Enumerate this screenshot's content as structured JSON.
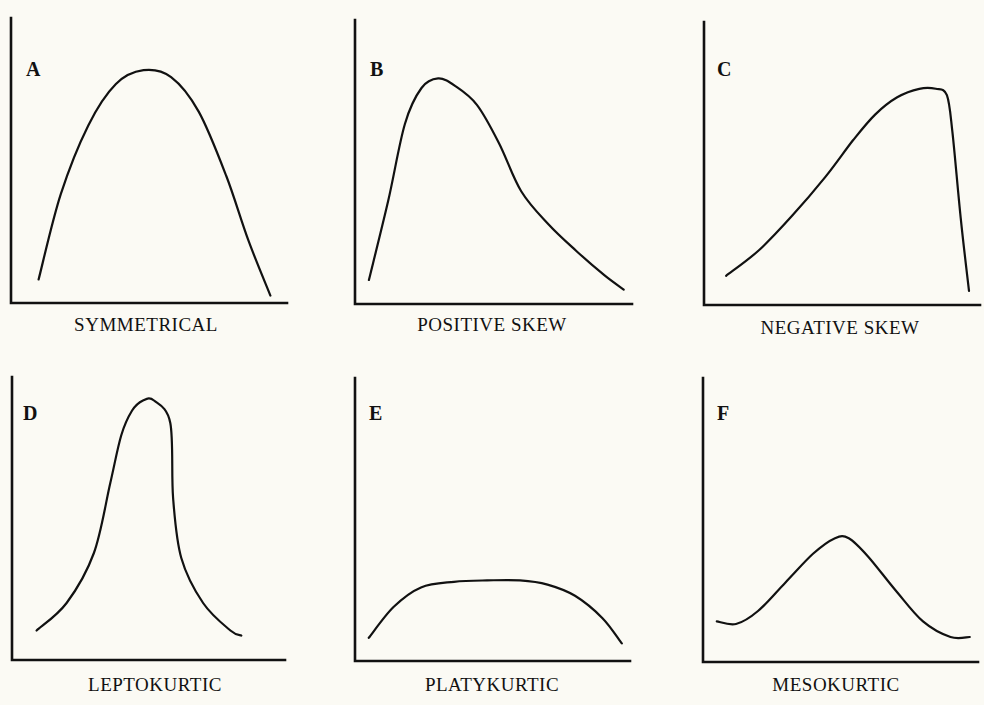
{
  "chart_data": [
    {
      "type": "line",
      "panel": "A",
      "caption": "SYMMETRICAL",
      "xlabel": "",
      "ylabel": "",
      "x": [
        0.1,
        0.18,
        0.28,
        0.38,
        0.48,
        0.58,
        0.68,
        0.78,
        0.86,
        0.94
      ],
      "y": [
        0.05,
        0.42,
        0.72,
        0.9,
        0.96,
        0.93,
        0.78,
        0.5,
        0.22,
        -0.02
      ]
    },
    {
      "type": "line",
      "panel": "B",
      "caption": "POSITIVE SKEW",
      "xlabel": "",
      "ylabel": "",
      "x": [
        0.05,
        0.12,
        0.18,
        0.24,
        0.3,
        0.36,
        0.44,
        0.52,
        0.6,
        0.7,
        0.8,
        0.9,
        0.97
      ],
      "y": [
        0.05,
        0.38,
        0.7,
        0.85,
        0.89,
        0.86,
        0.78,
        0.62,
        0.42,
        0.28,
        0.17,
        0.07,
        0.01
      ]
    },
    {
      "type": "line",
      "panel": "C",
      "caption": "NEGATIVE SKEW",
      "xlabel": "",
      "ylabel": "",
      "x": [
        0.08,
        0.2,
        0.32,
        0.44,
        0.54,
        0.62,
        0.7,
        0.78,
        0.84,
        0.88,
        0.9,
        0.93,
        0.96
      ],
      "y": [
        0.08,
        0.2,
        0.36,
        0.54,
        0.71,
        0.83,
        0.91,
        0.95,
        0.95,
        0.92,
        0.75,
        0.35,
        0.01
      ]
    },
    {
      "type": "line",
      "panel": "D",
      "caption": "LEPTOKURTIC",
      "xlabel": "",
      "ylabel": "",
      "x": [
        0.09,
        0.2,
        0.3,
        0.36,
        0.4,
        0.44,
        0.48,
        0.52,
        0.58,
        0.59,
        0.62,
        0.7,
        0.8,
        0.84
      ],
      "y": [
        0.07,
        0.18,
        0.38,
        0.66,
        0.85,
        0.95,
        0.99,
        0.99,
        0.9,
        0.6,
        0.36,
        0.18,
        0.07,
        0.05
      ]
    },
    {
      "type": "line",
      "panel": "E",
      "caption": "PLATYKURTIC",
      "xlabel": "",
      "ylabel": "",
      "x": [
        0.05,
        0.14,
        0.24,
        0.36,
        0.48,
        0.6,
        0.7,
        0.8,
        0.9,
        0.97
      ],
      "y": [
        0.04,
        0.15,
        0.22,
        0.24,
        0.245,
        0.245,
        0.23,
        0.19,
        0.11,
        0.02
      ]
    },
    {
      "type": "line",
      "panel": "F",
      "caption": "MESOKURTIC",
      "xlabel": "",
      "ylabel": "",
      "x": [
        0.05,
        0.12,
        0.2,
        0.3,
        0.4,
        0.48,
        0.53,
        0.6,
        0.7,
        0.8,
        0.9,
        0.97
      ],
      "y": [
        0.11,
        0.1,
        0.15,
        0.26,
        0.37,
        0.43,
        0.43,
        0.36,
        0.23,
        0.11,
        0.05,
        0.05
      ]
    }
  ]
}
